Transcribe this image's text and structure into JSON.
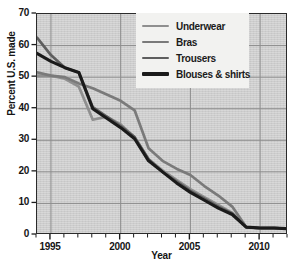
{
  "chart_data": {
    "type": "line",
    "title": "",
    "xlabel": "Year",
    "ylabel": "Percent U.S. made",
    "xlim": [
      1994,
      2012
    ],
    "ylim": [
      0,
      70
    ],
    "yticks": [
      0,
      10,
      20,
      30,
      40,
      50,
      60,
      70
    ],
    "xticks": [
      1995,
      2000,
      2005,
      2010
    ],
    "xtick_minor_step": 1,
    "grid": true,
    "legend_position": "top-right",
    "x": [
      1994,
      1995,
      1996,
      1997,
      1998,
      1999,
      2000,
      2001,
      2002,
      2003,
      2004,
      2005,
      2006,
      2007,
      2008,
      2009,
      2010,
      2011,
      2012
    ],
    "series": [
      {
        "name": "Underwear",
        "color": "#8f8f8f",
        "values": [
          50.5,
          50.5,
          49.5,
          47.0,
          36.5,
          37.5,
          35.0,
          31.0,
          24.0,
          20.5,
          17.5,
          14.5,
          12.0,
          9.5,
          7.0,
          2.5,
          2.2,
          2.2,
          2.0
        ]
      },
      {
        "name": "Bras",
        "color": "#7a7a7a",
        "values": [
          51.5,
          50.5,
          50.0,
          48.0,
          46.5,
          44.5,
          42.5,
          39.5,
          27.5,
          23.5,
          21.0,
          19.0,
          15.5,
          12.5,
          9.0,
          2.5,
          2.2,
          2.2,
          2.0
        ]
      },
      {
        "name": "Trousers",
        "color": "#5e5e5e",
        "values": [
          62.5,
          57.0,
          53.0,
          51.5,
          40.5,
          37.5,
          34.5,
          31.0,
          24.0,
          20.0,
          17.0,
          14.0,
          11.5,
          9.0,
          6.8,
          2.5,
          2.2,
          2.2,
          2.0
        ]
      },
      {
        "name": "Blouses & shirts",
        "color": "#1a1a1a",
        "values": [
          57.5,
          55.0,
          53.0,
          51.5,
          40.0,
          37.0,
          34.0,
          30.5,
          23.5,
          20.0,
          16.5,
          13.5,
          11.0,
          8.5,
          6.5,
          2.5,
          2.2,
          2.2,
          2.0
        ]
      }
    ]
  },
  "axes": {
    "ytick_labels": [
      "0",
      "10",
      "20",
      "30",
      "40",
      "50",
      "60",
      "70"
    ],
    "xtick_labels": [
      "1995",
      "2000",
      "2005",
      "2010"
    ],
    "x_axis_title": "Year",
    "y_axis_title": "Percent U.S. made"
  },
  "legend": {
    "items": [
      {
        "label": "Underwear"
      },
      {
        "label": "Bras"
      },
      {
        "label": "Trousers"
      },
      {
        "label": "Blouses & shirts"
      }
    ]
  }
}
